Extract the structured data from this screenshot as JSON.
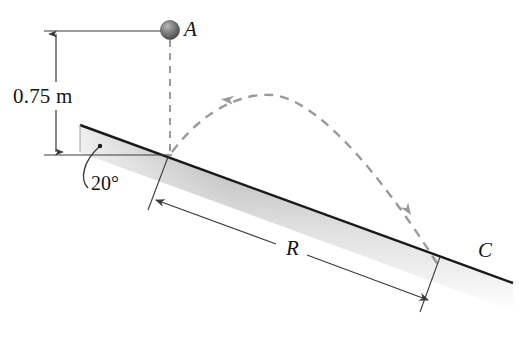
{
  "figure": {
    "background_color": "#ffffff",
    "line_color": "#3a3a3a",
    "dark_edge_color": "#1a1a1a",
    "dashed_color": "#9a9a9a",
    "ball_color": "#6e6e6e"
  },
  "labels": {
    "height": "0.75 m",
    "angle": "20°",
    "point_a": "A",
    "range": "R",
    "point_c": "C"
  },
  "annotations": {
    "height_dimension": {
      "value": "0.75 m",
      "type": "vertical-dimension",
      "arrows": "both"
    },
    "incline_angle": {
      "value": "20°",
      "type": "angle-callout",
      "leader": "curved"
    },
    "range_dimension": {
      "value": "R",
      "type": "inclined-dimension",
      "arrows": "both"
    },
    "trajectory": {
      "type": "dashed-parabola",
      "from": "B",
      "to": "C",
      "arrowheads": 2
    },
    "drop_line": {
      "type": "dashed-vertical",
      "from": "A",
      "to": "B"
    }
  },
  "points": {
    "a": {
      "label": "A",
      "role": "release-point"
    },
    "c": {
      "label": "C",
      "role": "landing-point"
    }
  },
  "incline": {
    "angle_degrees": 20,
    "description": "inclined plane sloping down to the right"
  }
}
